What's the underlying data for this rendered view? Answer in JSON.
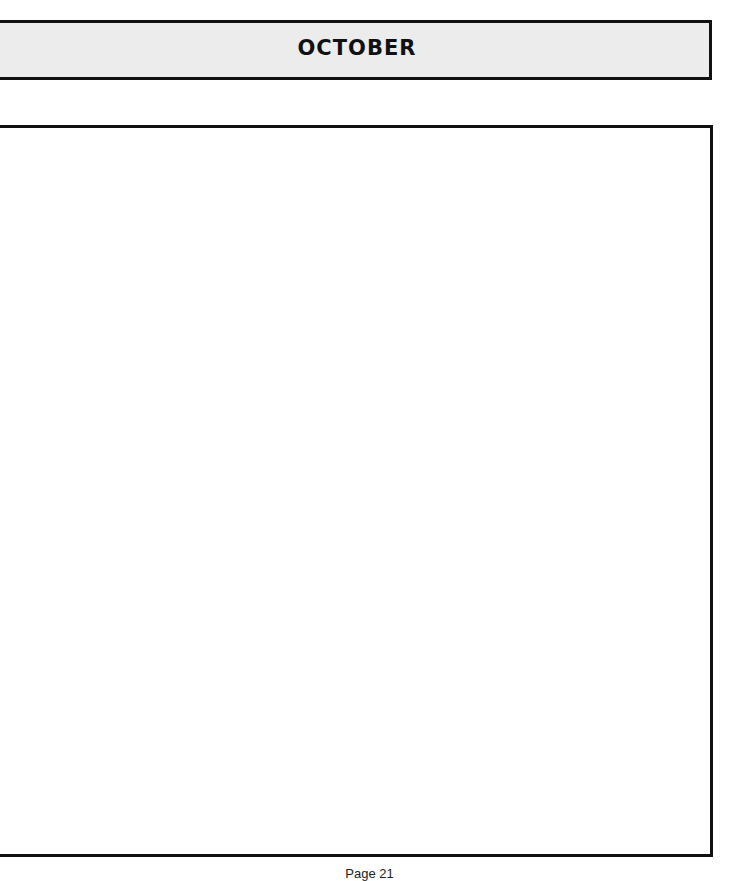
{
  "header": {
    "title": "OCTOBER"
  },
  "notes_area": {
    "content": ""
  },
  "footer": {
    "page_label": "Page 21"
  }
}
